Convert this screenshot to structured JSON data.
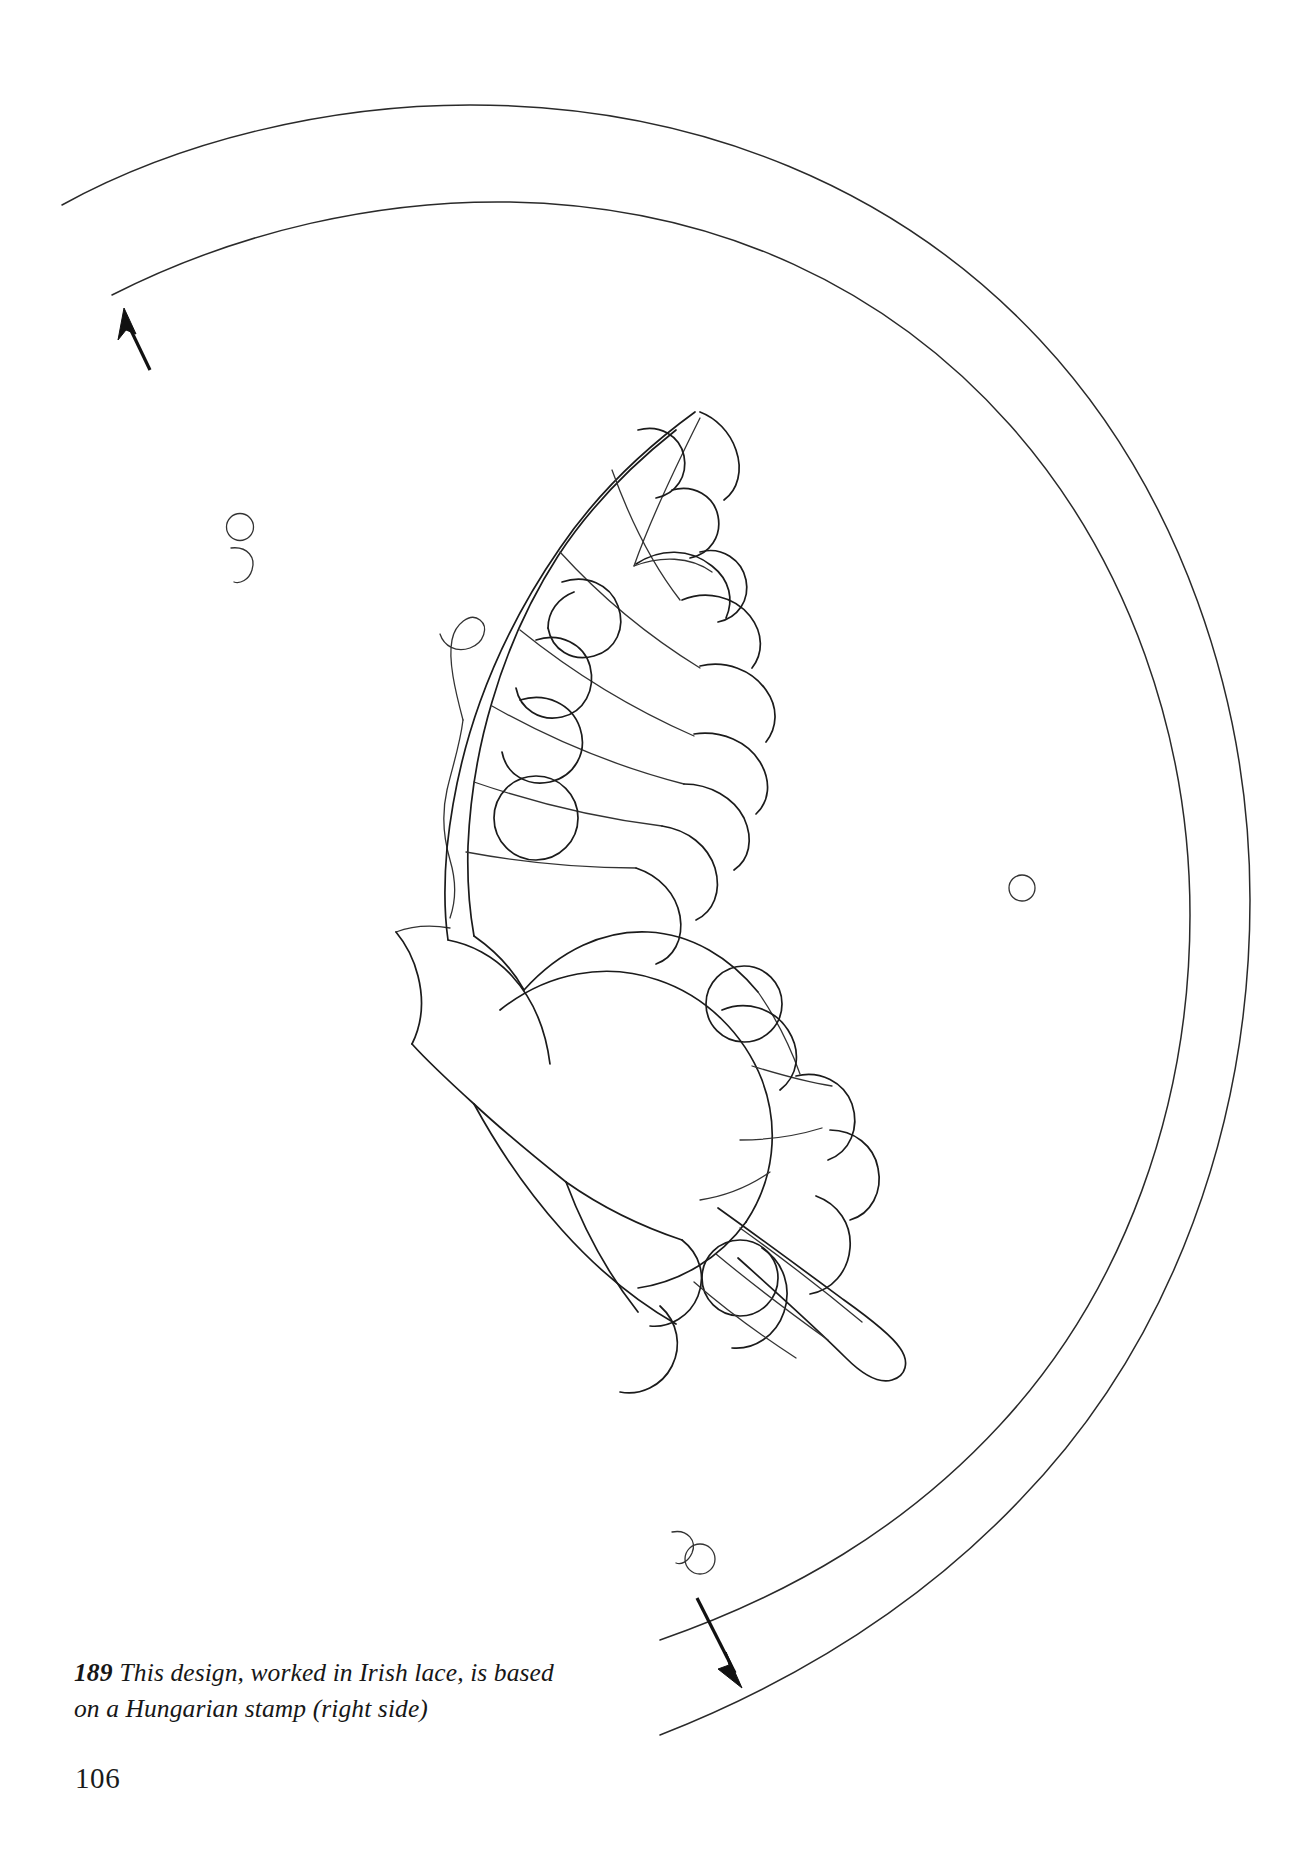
{
  "page": {
    "kind": "book-page",
    "background_color": "#ffffff",
    "ink_color": "#1b1b1b",
    "page_number": "106",
    "width": 1312,
    "height": 1859
  },
  "caption": {
    "figure_number": "189",
    "line_1": "This design, worked in Irish lace, is based",
    "line_2": "on a Hungarian stamp (right side)",
    "full_text": "189 This design, worked in Irish lace, is based on a Hungarian stamp (right side)"
  },
  "illustration": {
    "title": "butterfly-lace-pattern",
    "description": "Line drawing of a swallowtail butterfly in half profile, composed of scalloped lace motifs, set inside a double crescent-shaped border arc; two working-direction arrows and three small circle-and-arc stitch markers",
    "elements": [
      {
        "name": "outer-border-arc",
        "type": "crescent-arc"
      },
      {
        "name": "inner-border-arc",
        "type": "crescent-arc"
      },
      {
        "name": "butterfly-forewing",
        "type": "scalloped-wing"
      },
      {
        "name": "butterfly-hindwing",
        "type": "scalloped-wing"
      },
      {
        "name": "butterfly-body",
        "type": "body"
      },
      {
        "name": "butterfly-antenna",
        "type": "curled-line"
      },
      {
        "name": "butterfly-tail",
        "type": "tapered-tail"
      },
      {
        "name": "direction-arrow-top",
        "type": "arrow",
        "direction": "up-left"
      },
      {
        "name": "direction-arrow-bottom",
        "type": "arrow",
        "direction": "down-right"
      },
      {
        "name": "stitch-marker-left",
        "type": "circle-and-arc"
      },
      {
        "name": "stitch-marker-right",
        "type": "circle"
      },
      {
        "name": "stitch-marker-bottom",
        "type": "circle-and-arc"
      }
    ]
  }
}
